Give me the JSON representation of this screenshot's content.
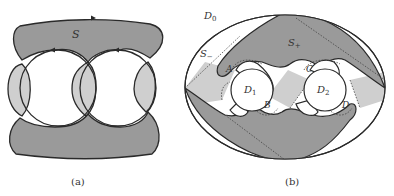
{
  "colors": {
    "dark_fill": "#9a9a9a",
    "light_fill": "#cfcfcf",
    "stroke": "#2a2a2a",
    "background": "#ffffff"
  },
  "panel_a": {
    "caption": "(a)",
    "surface_label": "S"
  },
  "panel_b": {
    "caption": "(b)",
    "outer_disk_label": "D",
    "outer_disk_sub": "0",
    "disk1_label": "D",
    "disk1_sub": "1",
    "disk2_label": "D",
    "disk2_sub": "2",
    "s_plus_label": "S",
    "s_plus_sub": "+",
    "s_minus_label": "S",
    "s_minus_sub": "−",
    "region_labels": [
      "A",
      "B",
      "C",
      "D"
    ]
  }
}
